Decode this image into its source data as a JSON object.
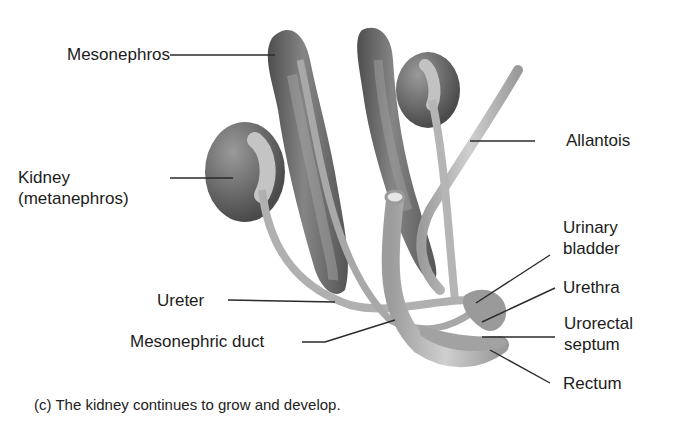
{
  "figure": {
    "caption": "(c) The kidney continues to grow and develop.",
    "labels": {
      "mesonephros": "Mesonephros",
      "kidney_line1": "Kidney",
      "kidney_line2": "(metanephros)",
      "allantois": "Allantois",
      "urinary_line1": "Urinary",
      "urinary_line2": "bladder",
      "urethra": "Urethra",
      "urorectal_line1": "Urorectal",
      "urorectal_line2": "septum",
      "rectum": "Rectum",
      "ureter": "Ureter",
      "mesonephric_duct": "Mesonephric duct"
    },
    "colors": {
      "organ_dark": "#5e5e5e",
      "organ_mid": "#8a8a8a",
      "duct_light": "#b8b8b8",
      "leader_line": "#2a2a2a"
    }
  }
}
